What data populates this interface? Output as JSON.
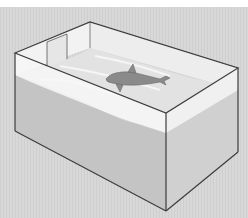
{
  "figure": {
    "colors": {
      "page_background": "#ffffff",
      "backdrop": "#d6d6d6",
      "tank_edge": "#3c3c3c",
      "air_space": "#f4f4f4",
      "water_surface": "#e2e2e2",
      "water_front": "#c4c4c4",
      "water_side": "#d0d0d0",
      "dolphin": "#8a8a8a"
    }
  }
}
